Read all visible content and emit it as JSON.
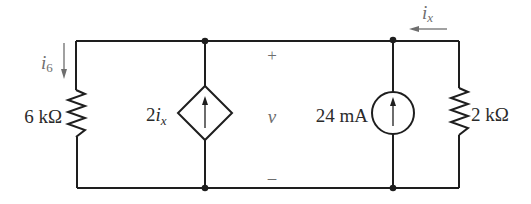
{
  "diagram": {
    "type": "circuit",
    "colors": {
      "wire": "#1e1e1e",
      "annotation": "#6e6e6e"
    },
    "elements": {
      "resistor_left": {
        "label": "6 kΩ"
      },
      "dependent_source": {
        "coef": "2",
        "var": "i",
        "sub": "x",
        "shape": "diamond",
        "direction": "up"
      },
      "voltage": {
        "plus": "+",
        "name": "v",
        "minus": "–"
      },
      "current_source": {
        "label": "24 mA",
        "direction": "up"
      },
      "resistor_right": {
        "label": "2 kΩ"
      }
    },
    "currents": {
      "i6": {
        "var": "i",
        "sub": "6",
        "direction": "down"
      },
      "ix": {
        "var": "i",
        "sub": "x",
        "direction": "left"
      }
    }
  }
}
